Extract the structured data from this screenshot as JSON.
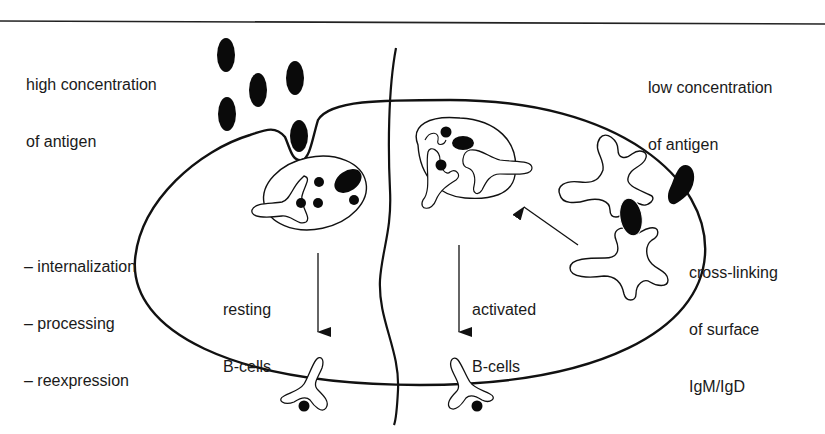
{
  "labels": {
    "left_top": {
      "line1": "high concentration",
      "line2": "of antigen"
    },
    "right_top": {
      "line1": "low concentration",
      "line2": "of antigen"
    },
    "left_steps": {
      "line1": "– internalization",
      "line2": "– processing",
      "line3": "– reexpression"
    },
    "resting": {
      "line1": "resting",
      "line2": "B-cells"
    },
    "activated": {
      "line1": "activated",
      "line2": "B-cells"
    },
    "crosslink": {
      "line1": "cross-linking",
      "line2": "of surface",
      "line3": "IgM/IgD"
    }
  },
  "colors": {
    "stroke": "#111111",
    "fill": "#ffffff",
    "antigen": "#0a0a0a"
  }
}
